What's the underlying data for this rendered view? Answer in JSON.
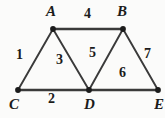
{
  "figure": {
    "kind": "graph-diagram",
    "background_color": "#fbfbfa",
    "stroke_color": "#3a3a3a",
    "text_color": "#1b1b1b",
    "width": 165,
    "height": 118
  },
  "vertices": [
    {
      "id": "A",
      "label": "A",
      "x": 53,
      "y": 29,
      "label_x": 46,
      "label_y": 4
    },
    {
      "id": "B",
      "label": "B",
      "x": 123,
      "y": 29,
      "label_x": 117,
      "label_y": 4
    },
    {
      "id": "C",
      "label": "C",
      "x": 18,
      "y": 90,
      "label_x": 9,
      "label_y": 97
    },
    {
      "id": "D",
      "label": "D",
      "x": 89,
      "y": 90,
      "label_x": 84,
      "label_y": 97
    },
    {
      "id": "E",
      "label": "E",
      "x": 158,
      "y": 90,
      "label_x": 154,
      "label_y": 97
    }
  ],
  "edges": [
    {
      "id": "e1",
      "label": "1",
      "from": "C",
      "to": "A",
      "label_x": 16,
      "label_y": 48
    },
    {
      "id": "e2",
      "label": "2",
      "from": "C",
      "to": "D",
      "label_x": 48,
      "label_y": 92
    },
    {
      "id": "e3",
      "label": "3",
      "from": "A",
      "to": "D",
      "label_x": 56,
      "label_y": 53
    },
    {
      "id": "e4",
      "label": "4",
      "from": "A",
      "to": "B",
      "label_x": 84,
      "label_y": 7
    },
    {
      "id": "e5",
      "label": "5",
      "from": "D",
      "to": "B",
      "label_x": 89,
      "label_y": 46
    },
    {
      "id": "e6",
      "label": "6",
      "from": "D",
      "to": "E",
      "label_x": 119,
      "label_y": 66
    },
    {
      "id": "e7",
      "label": "7",
      "from": "B",
      "to": "E",
      "label_x": 144,
      "label_y": 47
    }
  ]
}
